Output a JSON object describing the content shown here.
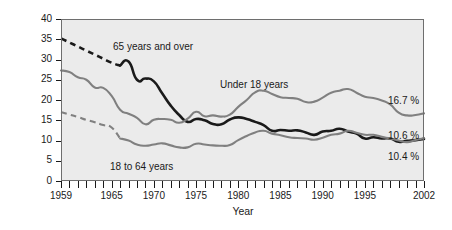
{
  "chart_data": {
    "type": "line",
    "title": "",
    "xlabel": "Year",
    "ylabel": "Percent Living in Poverty",
    "xlim": [
      1959,
      2002
    ],
    "ylim": [
      0,
      40
    ],
    "ytick_values": [
      0,
      5,
      10,
      15,
      20,
      25,
      30,
      35,
      40
    ],
    "ytick_labels": [
      "0",
      "5",
      "10",
      "15",
      "20",
      "25",
      "30",
      "35",
      "40"
    ],
    "xtick_labels": [
      "1959",
      "1965",
      "1970",
      "1975",
      "1980",
      "1985",
      "1990",
      "1995",
      "2002"
    ],
    "xtick_label_values": [
      1959,
      1965,
      1970,
      1975,
      1980,
      1985,
      1990,
      1995,
      2002
    ],
    "xticks_all_years": true,
    "grid": false,
    "legend_position": "inline-annotations",
    "x": [
      1959,
      1960,
      1961,
      1962,
      1963,
      1964,
      1965,
      1966,
      1967,
      1968,
      1969,
      1970,
      1971,
      1972,
      1973,
      1974,
      1975,
      1976,
      1977,
      1978,
      1979,
      1980,
      1981,
      1982,
      1983,
      1984,
      1985,
      1986,
      1987,
      1988,
      1989,
      1990,
      1991,
      1992,
      1993,
      1994,
      1995,
      1996,
      1997,
      1998,
      1999,
      2000,
      2001,
      2002
    ],
    "series": [
      {
        "name": "65 years and over",
        "color": "#1a1a1a",
        "style_early": "dashed",
        "style_late": "solid",
        "dash_until": 1966,
        "end_label": "10.4 %",
        "values": [
          35.2,
          34.2,
          33.2,
          32.2,
          31.2,
          30.2,
          29.2,
          28.5,
          29.5,
          25.0,
          25.3,
          24.6,
          21.6,
          18.6,
          16.3,
          14.6,
          15.3,
          15.0,
          14.1,
          14.0,
          15.2,
          15.7,
          15.3,
          14.6,
          13.8,
          12.4,
          12.6,
          12.4,
          12.5,
          12.0,
          11.4,
          12.2,
          12.4,
          12.9,
          12.2,
          11.7,
          10.5,
          10.8,
          10.5,
          10.5,
          9.7,
          9.9,
          10.1,
          10.4
        ]
      },
      {
        "name": "Under 18 years",
        "color": "#808080",
        "style_early": "solid",
        "style_late": "solid",
        "end_label": "16.7 %",
        "values": [
          27.3,
          26.9,
          25.6,
          25.0,
          23.1,
          23.0,
          21.0,
          17.6,
          16.6,
          15.6,
          14.0,
          15.1,
          15.3,
          15.1,
          14.4,
          15.4,
          17.1,
          16.0,
          16.2,
          15.9,
          16.4,
          18.3,
          20.0,
          21.9,
          22.3,
          21.5,
          20.7,
          20.5,
          20.3,
          19.5,
          19.6,
          20.6,
          21.8,
          22.3,
          22.7,
          21.8,
          20.8,
          20.5,
          19.9,
          18.9,
          16.9,
          16.2,
          16.3,
          16.7
        ]
      },
      {
        "name": "18 to 64 years",
        "color": "#808080",
        "style_early": "dashed",
        "style_late": "solid",
        "dash_until": 1966,
        "end_label": "10.6 %",
        "values": [
          17.0,
          16.4,
          15.8,
          15.1,
          14.5,
          13.8,
          13.2,
          10.5,
          10.0,
          9.0,
          8.7,
          9.0,
          9.3,
          8.8,
          8.3,
          8.3,
          9.2,
          9.0,
          8.8,
          8.7,
          8.9,
          10.1,
          11.1,
          12.0,
          12.4,
          11.7,
          11.3,
          10.8,
          10.6,
          10.5,
          10.2,
          10.7,
          11.4,
          11.7,
          12.4,
          11.9,
          11.4,
          11.4,
          10.9,
          10.5,
          10.0,
          9.6,
          10.1,
          10.6
        ]
      }
    ],
    "annotations": [
      {
        "text": "65 years and over",
        "series": "65 years and over",
        "x_px": 113,
        "y_px": 41
      },
      {
        "text": "Under 18 years",
        "series": "Under 18 years",
        "x_px": 220,
        "y_px": 79
      },
      {
        "text": "18 to 64 years",
        "series": "18 to 64 years",
        "x_px": 110,
        "y_px": 161
      }
    ],
    "end_labels": [
      {
        "text": "16.7 %",
        "x_px": 388,
        "y_px": 95
      },
      {
        "text": "10.6 %",
        "x_px": 388,
        "y_px": 130
      },
      {
        "text": "10.4 %",
        "x_px": 388,
        "y_px": 151
      }
    ],
    "colors": {
      "plot_background": "#ebebeb",
      "plot_border": "#6e6e6e",
      "axis_text": "#1a1a1a",
      "series_dark": "#1a1a1a",
      "series_gray": "#808080"
    }
  }
}
